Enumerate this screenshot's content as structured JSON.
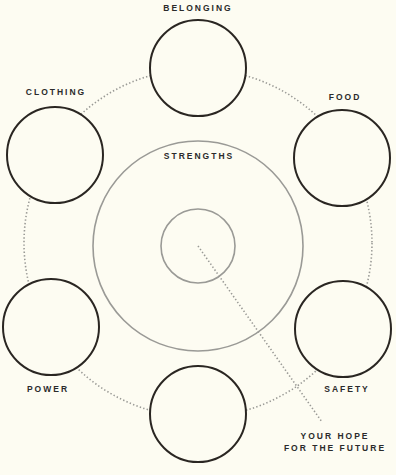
{
  "diagram": {
    "colors": {
      "background": "#fdfcf2",
      "need_circle_stroke": "#2a2622",
      "strengths_stroke": "#9a9a96",
      "dotted_stroke": "#9a9a96",
      "label": "#2b2b2b"
    },
    "center_label": "STRENGTHS",
    "hope_label_line1": "YOUR HOPE",
    "hope_label_line2": "FOR THE FUTURE",
    "needs": [
      {
        "id": "belonging",
        "label": "BELONGING"
      },
      {
        "id": "food",
        "label": "FOOD"
      },
      {
        "id": "safety",
        "label": "SAFETY"
      },
      {
        "id": "bottom",
        "label": ""
      },
      {
        "id": "power",
        "label": "POWER"
      },
      {
        "id": "clothing",
        "label": "CLOTHING"
      }
    ]
  }
}
